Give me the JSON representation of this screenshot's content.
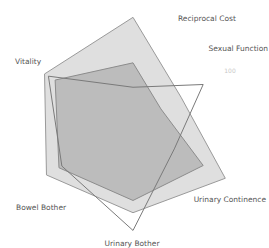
{
  "chart_data": {
    "type": "radar",
    "title": "",
    "axes": [
      "Reciprocal Cost",
      "Sexual Function",
      "Urinary Continence",
      "Urinary Bother",
      "Bowel Bother",
      "Vitality"
    ],
    "rmax": 100,
    "tick_label": "100",
    "series": [
      {
        "name": "Series A",
        "values": [
          97,
          50,
          96,
          79,
          90,
          92
        ],
        "fill": "#d9d9d9",
        "stroke": "#9a9a9a",
        "fill_opacity": 0.85
      },
      {
        "name": "Series B",
        "values": [
          56,
          29,
          73,
          68,
          77,
          81
        ],
        "fill": "#b3b3b3",
        "stroke": "#8c8c8c",
        "fill_opacity": 0.8
      },
      {
        "name": "Series C",
        "values": [
          34,
          73,
          43,
          95,
          74,
          88
        ],
        "fill": "none",
        "stroke": "#7a7a7a",
        "fill_opacity": 0
      }
    ]
  }
}
